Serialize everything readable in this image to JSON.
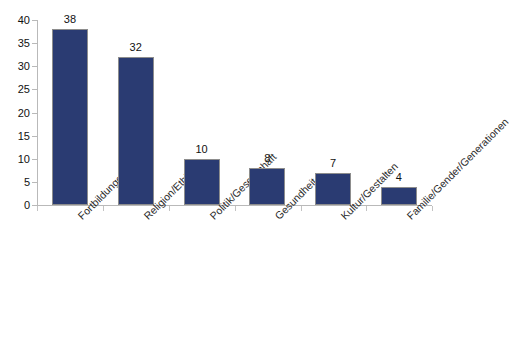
{
  "chart_data": {
    "type": "bar",
    "title": "",
    "subtitle": "",
    "xlabel": "",
    "ylabel": "",
    "ylim": [
      0,
      40
    ],
    "ytick_step": 5,
    "yticks": [
      0,
      5,
      10,
      15,
      20,
      25,
      30,
      35,
      40
    ],
    "grid": false,
    "legend": false,
    "legend_position": "none",
    "categories": [
      "Fortbildungen",
      "Religion/Ethik",
      "Politik/Gesellschaft",
      "Gesundheit",
      "Kultur/Gestalten",
      "Familie/Gender/Generationen"
    ],
    "values": [
      38,
      32,
      10,
      8,
      7,
      4
    ],
    "data_labels": [
      "38",
      "32",
      "10",
      "8",
      "7",
      "4"
    ],
    "category_label_rotation_deg": -45,
    "colors": {
      "bar_fill": "#2a3b72",
      "bar_edge": "#8d8d8d",
      "axis": "#b9b9b9",
      "text": "#111111",
      "background": "#ffffff"
    }
  }
}
